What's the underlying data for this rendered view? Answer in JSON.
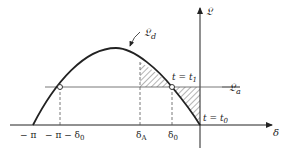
{
  "diagram": {
    "type": "power-angle curve (equal area criterion)",
    "axes": {
      "x_label": "δ",
      "y_label": "𝔏"
    },
    "curves": {
      "disturbed_curve_label": "𝔏",
      "disturbed_curve_sub": "d",
      "load_line_label": "𝔏",
      "load_line_sub": "a"
    },
    "x_ticks": {
      "neg_pi": "− π",
      "neg_pi_minus_delta0": "− π − δ",
      "neg_pi_minus_delta0_sub": "0",
      "delta_A": "δ",
      "delta_A_sub": "A",
      "delta_0": "δ",
      "delta_0_sub": "0"
    },
    "annotations": {
      "t1": "t = t",
      "t1_sub": "1",
      "t0": "t = t",
      "t0_sub": "0"
    },
    "colors": {
      "stroke": "#222222",
      "guide": "#555555",
      "hatch": "#444444"
    }
  }
}
